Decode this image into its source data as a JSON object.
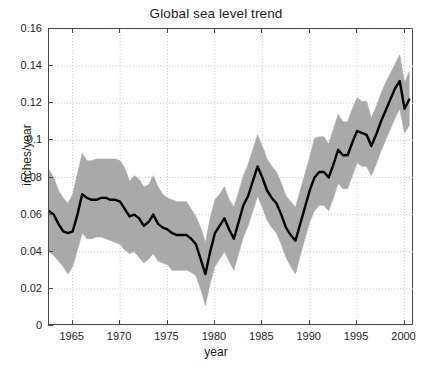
{
  "chart_data": {
    "type": "line",
    "title": "Global sea level trend",
    "xlabel": "year",
    "ylabel": "inches/year",
    "xlim": [
      1962.5,
      2001.0
    ],
    "ylim": [
      0,
      0.16
    ],
    "xticks": [
      1965,
      1970,
      1975,
      1980,
      1985,
      1990,
      1995,
      2000
    ],
    "xtick_labels": [
      "1965",
      "1970",
      "1975",
      "1980",
      "1985",
      "1990",
      "1995",
      "2000"
    ],
    "yticks": [
      0,
      0.02,
      0.04,
      0.06,
      0.08,
      0.1,
      0.12,
      0.14,
      0.16
    ],
    "ytick_labels": [
      "0",
      "0.02",
      "0.04",
      "0.06",
      "0.08",
      "0.1",
      "0.12",
      "0.14",
      "0.16"
    ],
    "grid": true,
    "grid_style": "dotted",
    "legend": null,
    "band_label": "uncertainty band",
    "line_color": "#000000",
    "band_color": "#a9a9a9",
    "grid_color": "#cfcfcf",
    "axis_color": "#4a4a4a",
    "x": [
      1962.5,
      1963.0,
      1963.5,
      1964.0,
      1964.5,
      1965.0,
      1965.5,
      1966.0,
      1966.5,
      1967.0,
      1967.5,
      1968.0,
      1968.5,
      1969.0,
      1969.5,
      1970.0,
      1970.5,
      1971.0,
      1971.5,
      1972.0,
      1972.5,
      1973.0,
      1973.5,
      1974.0,
      1974.5,
      1975.0,
      1975.5,
      1976.0,
      1976.5,
      1977.0,
      1977.5,
      1978.0,
      1978.5,
      1979.0,
      1979.5,
      1980.0,
      1980.5,
      1981.0,
      1981.5,
      1982.0,
      1982.5,
      1983.0,
      1983.5,
      1984.0,
      1984.5,
      1985.0,
      1985.5,
      1986.0,
      1986.5,
      1987.0,
      1987.5,
      1988.0,
      1988.5,
      1989.0,
      1989.5,
      1990.0,
      1990.5,
      1991.0,
      1991.5,
      1992.0,
      1992.5,
      1993.0,
      1993.5,
      1994.0,
      1994.5,
      1995.0,
      1995.5,
      1996.0,
      1996.5,
      1997.0,
      1997.5,
      1998.0,
      1998.5,
      1999.0,
      1999.5,
      2000.0,
      2000.5
    ],
    "series": [
      {
        "name": "trend",
        "values": [
          0.062,
          0.06,
          0.055,
          0.051,
          0.05,
          0.051,
          0.06,
          0.071,
          0.069,
          0.068,
          0.068,
          0.069,
          0.069,
          0.068,
          0.068,
          0.067,
          0.063,
          0.059,
          0.06,
          0.058,
          0.054,
          0.056,
          0.06,
          0.055,
          0.053,
          0.052,
          0.05,
          0.049,
          0.049,
          0.049,
          0.047,
          0.044,
          0.036,
          0.028,
          0.04,
          0.05,
          0.054,
          0.058,
          0.052,
          0.047,
          0.056,
          0.065,
          0.07,
          0.078,
          0.086,
          0.08,
          0.073,
          0.069,
          0.066,
          0.06,
          0.053,
          0.049,
          0.046,
          0.055,
          0.064,
          0.073,
          0.08,
          0.083,
          0.083,
          0.08,
          0.087,
          0.095,
          0.092,
          0.092,
          0.099,
          0.105,
          0.104,
          0.103,
          0.097,
          0.103,
          0.11,
          0.116,
          0.122,
          0.128,
          0.132,
          0.117,
          0.122
        ]
      },
      {
        "name": "upper_bound",
        "values": [
          0.084,
          0.08,
          0.073,
          0.069,
          0.066,
          0.071,
          0.082,
          0.093,
          0.089,
          0.089,
          0.09,
          0.09,
          0.09,
          0.09,
          0.09,
          0.089,
          0.085,
          0.078,
          0.081,
          0.079,
          0.075,
          0.076,
          0.081,
          0.075,
          0.071,
          0.069,
          0.068,
          0.067,
          0.067,
          0.067,
          0.063,
          0.059,
          0.053,
          0.045,
          0.058,
          0.068,
          0.071,
          0.075,
          0.068,
          0.064,
          0.072,
          0.081,
          0.087,
          0.095,
          0.103,
          0.097,
          0.09,
          0.086,
          0.083,
          0.077,
          0.07,
          0.067,
          0.064,
          0.073,
          0.082,
          0.091,
          0.101,
          0.102,
          0.102,
          0.098,
          0.106,
          0.114,
          0.11,
          0.11,
          0.117,
          0.123,
          0.121,
          0.121,
          0.112,
          0.118,
          0.125,
          0.131,
          0.136,
          0.141,
          0.146,
          0.131,
          0.137
        ]
      },
      {
        "name": "lower_bound",
        "values": [
          0.04,
          0.038,
          0.035,
          0.032,
          0.028,
          0.032,
          0.041,
          0.05,
          0.047,
          0.047,
          0.048,
          0.048,
          0.047,
          0.046,
          0.045,
          0.044,
          0.041,
          0.039,
          0.04,
          0.037,
          0.034,
          0.036,
          0.039,
          0.035,
          0.034,
          0.033,
          0.03,
          0.03,
          0.03,
          0.03,
          0.029,
          0.027,
          0.02,
          0.011,
          0.023,
          0.032,
          0.036,
          0.04,
          0.035,
          0.03,
          0.039,
          0.048,
          0.054,
          0.062,
          0.07,
          0.064,
          0.057,
          0.053,
          0.05,
          0.044,
          0.037,
          0.032,
          0.028,
          0.038,
          0.047,
          0.056,
          0.062,
          0.065,
          0.065,
          0.062,
          0.069,
          0.077,
          0.074,
          0.074,
          0.081,
          0.088,
          0.086,
          0.086,
          0.081,
          0.087,
          0.094,
          0.1,
          0.106,
          0.112,
          0.117,
          0.104,
          0.108
        ]
      }
    ]
  }
}
